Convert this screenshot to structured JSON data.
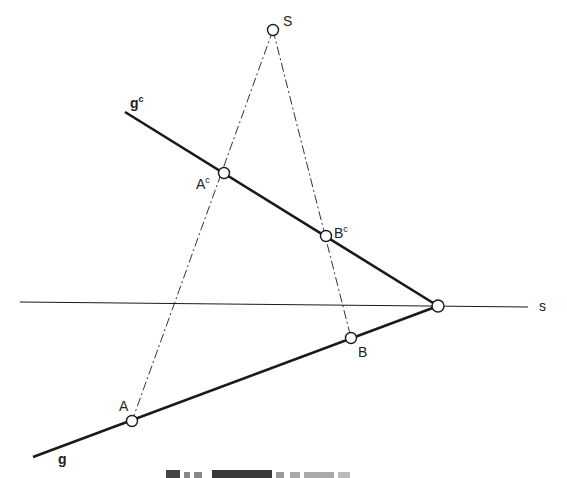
{
  "diagram": {
    "colors": {
      "line": "#1a1a1a",
      "dashed": "#333333",
      "point_fill": "#ffffff",
      "text": "#222222"
    },
    "labels": {
      "center": "S",
      "line_image": "g",
      "line_image_sup": "c",
      "trace": "s",
      "point_A_image": "A",
      "point_A_image_sup": "c",
      "point_B_image": "B",
      "point_B_image_sup": "c",
      "point_A": "A",
      "point_B": "B",
      "line_original": "g"
    },
    "caption": "",
    "points": {
      "S": [
        273,
        30
      ],
      "Ac": [
        224,
        173
      ],
      "Bc": [
        326,
        236
      ],
      "apex": [
        438,
        306
      ],
      "B": [
        351,
        338
      ],
      "A": [
        132,
        421
      ]
    },
    "lines": {
      "gc": {
        "from": [
          125,
          112
        ],
        "to": [
          438,
          306
        ],
        "style": "solid-thick"
      },
      "g": {
        "from": [
          33,
          457
        ],
        "to": [
          438,
          306
        ],
        "style": "solid-thick"
      },
      "s": {
        "from": [
          20,
          302
        ],
        "to": [
          528,
          307
        ],
        "style": "solid-thin"
      },
      "SA": {
        "from": [
          273,
          30
        ],
        "to": [
          132,
          421
        ],
        "style": "dashed"
      },
      "SB": {
        "from": [
          273,
          30
        ],
        "to": [
          351,
          338
        ],
        "style": "dashed"
      }
    }
  }
}
